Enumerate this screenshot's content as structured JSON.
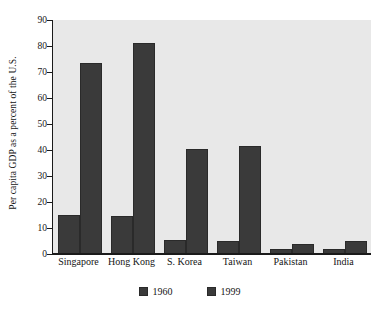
{
  "chart_data": {
    "type": "bar",
    "title": "",
    "subtitle": "",
    "xlabel": "",
    "ylabel": "Per capita GDP as a percent of the U.S.",
    "ylim": [
      0,
      90
    ],
    "ytick_step": 10,
    "yticks": [
      "0",
      "10",
      "20",
      "30",
      "40",
      "50",
      "60",
      "70",
      "80",
      "90"
    ],
    "grid": false,
    "legend_position": "bottom-center",
    "categories": [
      "Singapore",
      "Hong Kong",
      "S. Korea",
      "Taiwan",
      "Pakistan",
      "India"
    ],
    "series": [
      {
        "name": "1960",
        "values": [
          15,
          14.5,
          5.5,
          5,
          2,
          2
        ]
      },
      {
        "name": "1999",
        "values": [
          73.5,
          81,
          40.5,
          41.5,
          4,
          5
        ]
      }
    ]
  },
  "colors": {
    "bar": "#3a3a3a",
    "bar_edge": "#2a2a2a",
    "plot_background": "#e8e8e8",
    "figure_background": "#ffffff",
    "axis": "#1a1a1a",
    "text": "#151515"
  },
  "legend": {
    "entries": [
      {
        "label": "1960"
      },
      {
        "label": "1999"
      }
    ]
  }
}
